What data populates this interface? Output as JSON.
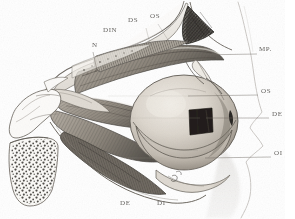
{
  "figure": {
    "kind": "anatomical-engraving",
    "technique": "lithograph / stipple-and-hatch engraving",
    "background_color": "#ffffff",
    "ink_color": "#4c4a46",
    "paper_tone": "#f4f2ee",
    "width": 295,
    "height": 219
  },
  "labels": [
    {
      "id": "n",
      "text": "N",
      "x": 92,
      "y": 45,
      "size": "small",
      "leader": true
    },
    {
      "id": "din",
      "text": "DIN",
      "x": 103,
      "y": 30,
      "size": "small",
      "leader": false
    },
    {
      "id": "ds",
      "text": "DS",
      "x": 128,
      "y": 20,
      "size": "small",
      "leader": false
    },
    {
      "id": "os_t",
      "text": "OS",
      "x": 150,
      "y": 16,
      "size": "small",
      "leader": false
    },
    {
      "id": "mp",
      "text": "MP.",
      "x": 259,
      "y": 50,
      "size": "small",
      "leader": true
    },
    {
      "id": "os_r",
      "text": "OS",
      "x": 261,
      "y": 91,
      "size": "small",
      "leader": true
    },
    {
      "id": "de_r",
      "text": "DE",
      "x": 272,
      "y": 114,
      "size": "small",
      "leader": true
    },
    {
      "id": "oi",
      "text": "OI",
      "x": 274,
      "y": 153,
      "size": "small",
      "leader": true
    },
    {
      "id": "de_b",
      "text": "DE",
      "x": 120,
      "y": 203,
      "size": "small",
      "leader": false
    },
    {
      "id": "di_b",
      "text": "DI",
      "x": 157,
      "y": 203,
      "size": "small",
      "leader": false
    }
  ],
  "leader_lines": [
    {
      "id": "leader-mp",
      "from_x": 196,
      "from_y": 55,
      "to_x": 257,
      "to_y": 54
    },
    {
      "id": "leader-os",
      "from_x": 188,
      "from_y": 96,
      "to_x": 258,
      "to_y": 95
    },
    {
      "id": "leader-de",
      "from_x": 206,
      "from_y": 118,
      "to_x": 269,
      "to_y": 118
    },
    {
      "id": "leader-oi",
      "from_x": 205,
      "from_y": 158,
      "to_x": 271,
      "to_y": 157
    },
    {
      "id": "leader-n",
      "from_x": 93,
      "from_y": 52,
      "to_x": 97,
      "to_y": 70
    }
  ],
  "structures": [
    {
      "id": "cancellous-bone",
      "name": "spongy bone (cut surface, stippled)"
    },
    {
      "id": "orbital-roof",
      "name": "orbital roof / frontal bone outline"
    },
    {
      "id": "globe",
      "name": "eyeball (globe)"
    },
    {
      "id": "cornea-window",
      "name": "dark rectangular aperture in globe"
    },
    {
      "id": "superior-rectus",
      "name": "superior rectus muscle"
    },
    {
      "id": "levator",
      "name": "levator palpebrae superioris"
    },
    {
      "id": "lateral-rectus",
      "name": "lateral rectus muscle"
    },
    {
      "id": "inferior-rectus",
      "name": "inferior rectus muscle"
    },
    {
      "id": "optic-nerve",
      "name": "optic nerve"
    },
    {
      "id": "face-profile",
      "name": "faint facial profile contour at right"
    }
  ]
}
